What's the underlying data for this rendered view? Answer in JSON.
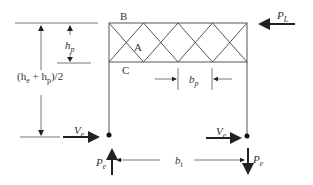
{
  "diagram": {
    "labels": {
      "B": "B",
      "A": "A",
      "C": "C",
      "hp": "h",
      "hp_sub": "p",
      "half_height": "(h",
      "half_height_sub1": "e",
      "half_height_mid": " + h",
      "half_height_sub2": "p",
      "half_height_end": ")/2",
      "bp": "b",
      "bp_sub": "p",
      "bt": "b",
      "bt_sub": "t",
      "PL": "P",
      "PL_sub": "L",
      "Ve": "V",
      "Ve_sub": "e",
      "Pe": "P",
      "Pe_sub": "e"
    },
    "colors": {
      "line": "#555555",
      "arrow": "#222222"
    }
  }
}
